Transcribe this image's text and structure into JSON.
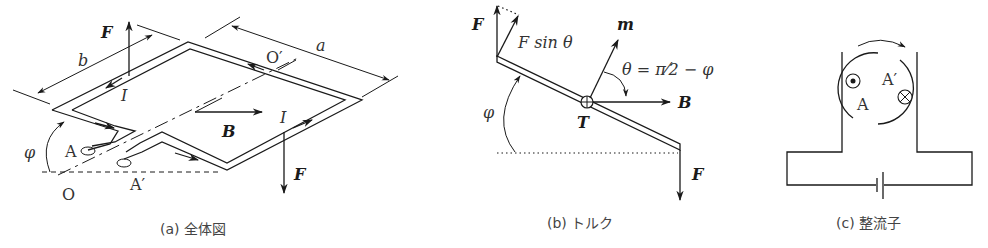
{
  "panels": [
    {
      "id": "a",
      "caption": "(a) 全体図",
      "labels": {
        "force_top": "F",
        "force_bottom": "F",
        "width": "b",
        "length": "a",
        "axis_end_top": "O′",
        "axis_end_bottom": "O",
        "current_top": "I",
        "current_right": "I",
        "field": "B",
        "angle": "φ",
        "terminal_a": "A",
        "terminal_a_prime": "A′"
      }
    },
    {
      "id": "b",
      "caption": "(b) トルク",
      "labels": {
        "force_top": "F",
        "force_component": "F sin θ",
        "moment": "m",
        "angle_relation": "θ = π⁄2 − φ",
        "field": "B",
        "torque": "T",
        "angle": "φ",
        "force_bottom": "F"
      }
    },
    {
      "id": "c",
      "caption": "(c) 整流子",
      "labels": {
        "terminal_a": "A",
        "terminal_a_prime": "A′"
      }
    }
  ]
}
